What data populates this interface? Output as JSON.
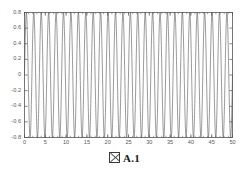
{
  "figure": {
    "caption_symbol": "図",
    "caption_text": "A.1"
  },
  "chart_data": {
    "type": "line",
    "title": "",
    "subtitle": "",
    "xlabel": "",
    "ylabel": "",
    "xlim": [
      0,
      50
    ],
    "ylim": [
      -0.8,
      0.8
    ],
    "grid": false,
    "legend": null,
    "legend_position": "none",
    "line_color": "#555555",
    "line_width": 0.6,
    "frame_color": "#555555",
    "background": "#ffffff",
    "xticks": [
      0,
      5,
      10,
      15,
      20,
      25,
      30,
      35,
      40,
      45,
      50
    ],
    "xtick_labels": [
      "0",
      "5",
      "10",
      "15",
      "20",
      "25",
      "30",
      "35",
      "40",
      "45",
      "50"
    ],
    "xminor_tick_step": 1,
    "yticks": [
      -0.8,
      -0.6,
      -0.4,
      -0.2,
      0,
      0.2,
      0.4,
      0.6,
      0.8
    ],
    "ytick_labels": [
      "-0.8",
      "-0.6",
      "-0.4",
      "-0.2",
      "0",
      "0.2",
      "0.4",
      "0.6",
      "0.8"
    ],
    "series": [
      {
        "name": "oscillation",
        "description": "high-frequency sinusoid, amplitude 0.8, period about 1.79 (approx 28 cycles over x = 0 to 50)",
        "amplitude": 0.8,
        "period": 1.7857,
        "phase": 0,
        "offset": 0,
        "n_cycles": 28,
        "n_samples": 2400
      }
    ]
  }
}
